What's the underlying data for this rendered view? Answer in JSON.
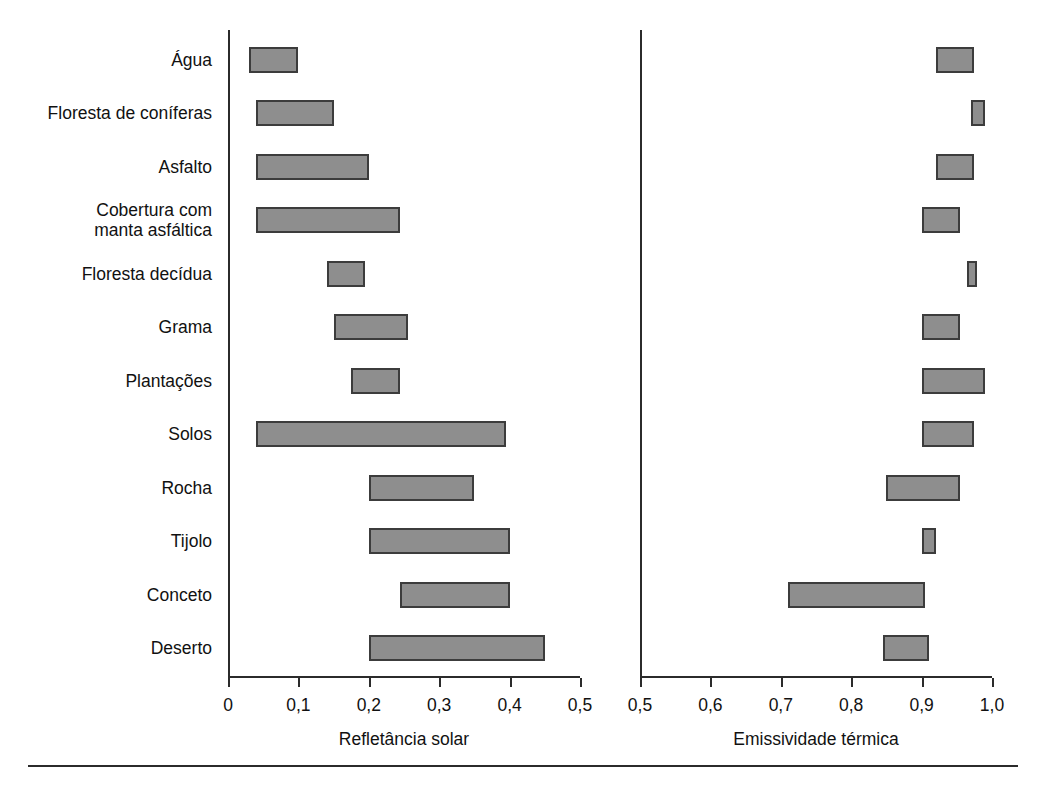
{
  "figure": {
    "categories": [
      "Água",
      "Floresta de coníferas",
      "Asfalto",
      "Cobertura com\nmanta asfáltica",
      "Floresta decídua",
      "Grama",
      "Plantações",
      "Solos",
      "Rocha",
      "Tijolo",
      "Conceto",
      "Deserto"
    ],
    "bar_color": "#8e8e8e",
    "bar_edge_color": "#3c3c3c",
    "axis_color": "#2b2b2b"
  },
  "chart_data": [
    {
      "type": "bar",
      "orientation": "horizontal",
      "subtype": "range-bar",
      "title": "",
      "xlabel": "Refletância solar",
      "ylabel": "",
      "xlim": [
        0,
        0.5
      ],
      "grid": false,
      "legend": "none",
      "tick_labels": [
        "0",
        "0,1",
        "0,2",
        "0,3",
        "0,4",
        "0,5"
      ],
      "ticks": [
        0,
        0.1,
        0.2,
        0.3,
        0.4,
        0.5
      ],
      "categories": [
        "Água",
        "Floresta de coníferas",
        "Asfalto",
        "Cobertura com manta asfáltica",
        "Floresta decídua",
        "Grama",
        "Plantações",
        "Solos",
        "Rocha",
        "Tijolo",
        "Conceto",
        "Deserto"
      ],
      "ranges": [
        [
          0.03,
          0.1
        ],
        [
          0.04,
          0.15
        ],
        [
          0.04,
          0.2
        ],
        [
          0.04,
          0.245
        ],
        [
          0.14,
          0.195
        ],
        [
          0.15,
          0.255
        ],
        [
          0.175,
          0.245
        ],
        [
          0.04,
          0.395
        ],
        [
          0.2,
          0.35
        ],
        [
          0.2,
          0.4
        ],
        [
          0.245,
          0.4
        ],
        [
          0.2,
          0.45
        ]
      ]
    },
    {
      "type": "bar",
      "orientation": "horizontal",
      "subtype": "range-bar",
      "title": "",
      "xlabel": "Emissividade térmica",
      "ylabel": "",
      "xlim": [
        0.5,
        1.0
      ],
      "grid": false,
      "legend": "none",
      "tick_labels": [
        "0,5",
        "0,6",
        "0,7",
        "0,8",
        "0,9",
        "1,0"
      ],
      "ticks": [
        0.5,
        0.6,
        0.7,
        0.8,
        0.9,
        1.0
      ],
      "categories": [
        "Água",
        "Floresta de coníferas",
        "Asfalto",
        "Cobertura com manta asfáltica",
        "Floresta decídua",
        "Grama",
        "Plantações",
        "Solos",
        "Rocha",
        "Tijolo",
        "Conceto",
        "Deserto"
      ],
      "ranges": [
        [
          0.92,
          0.975
        ],
        [
          0.97,
          0.99
        ],
        [
          0.92,
          0.975
        ],
        [
          0.9,
          0.955
        ],
        [
          0.965,
          0.978
        ],
        [
          0.9,
          0.955
        ],
        [
          0.9,
          0.99
        ],
        [
          0.9,
          0.975
        ],
        [
          0.85,
          0.955
        ],
        [
          0.9,
          0.92
        ],
        [
          0.71,
          0.905
        ],
        [
          0.845,
          0.91
        ]
      ]
    }
  ]
}
